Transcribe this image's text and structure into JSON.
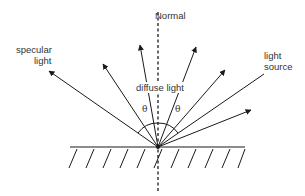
{
  "labels": {
    "normal": "Normal",
    "specular_line1": "specular",
    "specular_line2": "light",
    "diffuse": "diffuse light",
    "source_line1": "light",
    "source_line2": "source",
    "theta_left": "θ",
    "theta_right": "θ"
  },
  "colors": {
    "line": "#1a1a1a",
    "text": "#333333",
    "background": "#ffffff"
  },
  "geometry": {
    "incidence_point": [
      158,
      147
    ],
    "surface": {
      "x1": 70,
      "x2": 245,
      "y": 147
    },
    "hatch_count": 11,
    "normal": {
      "y_top": 12,
      "y_bottom": 192
    }
  }
}
